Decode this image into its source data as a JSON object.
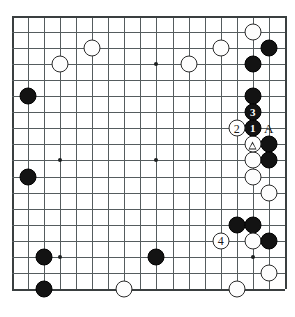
{
  "diagram": {
    "kind": "go-board-diagram",
    "board_size": 19,
    "visible_columns": 18,
    "visible_rows": 18,
    "origin_x": 12,
    "origin_y": 16,
    "cell": 16.05,
    "colors": {
      "black_stone": "#131313",
      "white_stone": "#fdfdfd",
      "stone_outline": "#2b2b2b",
      "grid_line": "#555c5e",
      "edge_line": "#3a3f40",
      "board_background": "#ffffff",
      "label_text": "#111111"
    },
    "hoshi": [
      {
        "col": 4,
        "row": 4
      },
      {
        "col": 10,
        "row": 4
      },
      {
        "col": 4,
        "row": 10
      },
      {
        "col": 10,
        "row": 10
      },
      {
        "col": 16,
        "row": 10
      },
      {
        "col": 4,
        "row": 16
      },
      {
        "col": 10,
        "row": 16
      },
      {
        "col": 16,
        "row": 16
      }
    ],
    "stones": [
      {
        "color": "white",
        "col": 16,
        "row": 2
      },
      {
        "color": "white",
        "col": 14,
        "row": 3
      },
      {
        "color": "black",
        "col": 17,
        "row": 3
      },
      {
        "color": "white",
        "col": 6,
        "row": 3
      },
      {
        "color": "white",
        "col": 4,
        "row": 4
      },
      {
        "color": "white",
        "col": 12,
        "row": 4
      },
      {
        "color": "black",
        "col": 16,
        "row": 4
      },
      {
        "color": "black",
        "col": 2,
        "row": 6
      },
      {
        "color": "black",
        "col": 16,
        "row": 6
      },
      {
        "color": "black",
        "col": 17,
        "row": 9
      },
      {
        "color": "white",
        "col": 16,
        "row": 10
      },
      {
        "color": "black",
        "col": 17,
        "row": 10
      },
      {
        "color": "white",
        "col": 16,
        "row": 11
      },
      {
        "color": "black",
        "col": 2,
        "row": 11
      },
      {
        "color": "white",
        "col": 17,
        "row": 12
      },
      {
        "color": "black",
        "col": 15,
        "row": 14
      },
      {
        "color": "black",
        "col": 16,
        "row": 14
      },
      {
        "color": "white",
        "col": 16,
        "row": 15
      },
      {
        "color": "black",
        "col": 17,
        "row": 15
      },
      {
        "color": "black",
        "col": 3,
        "row": 16
      },
      {
        "color": "black",
        "col": 10,
        "row": 16
      },
      {
        "color": "white",
        "col": 17,
        "row": 17
      },
      {
        "color": "black",
        "col": 3,
        "row": 18
      },
      {
        "color": "white",
        "col": 8,
        "row": 18
      },
      {
        "color": "white",
        "col": 15,
        "row": 18
      }
    ],
    "move_markers": [
      {
        "label": "1",
        "color": "black",
        "col": 16,
        "row": 8
      },
      {
        "label": "2",
        "color": "white",
        "col": 15,
        "row": 8
      },
      {
        "label": "3",
        "color": "black",
        "col": 16,
        "row": 7
      },
      {
        "label": "4",
        "color": "white",
        "col": 14,
        "row": 15
      }
    ],
    "triangle_markers": [
      {
        "color": "white",
        "col": 16,
        "row": 9,
        "symbol": "triangle"
      }
    ],
    "letter_labels": [
      {
        "text": "A",
        "col": 17,
        "row": 8
      }
    ]
  }
}
